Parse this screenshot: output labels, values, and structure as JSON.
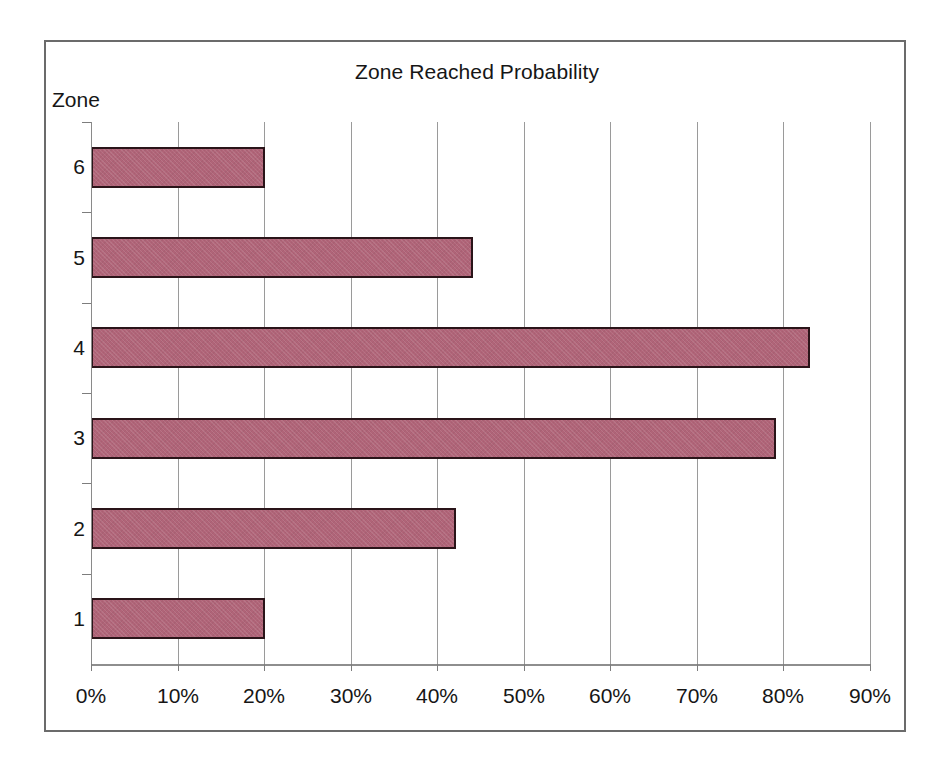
{
  "chart_data": {
    "type": "bar",
    "orientation": "horizontal",
    "title": "Zone Reached Probability",
    "xlabel": "",
    "ylabel": "Zone",
    "categories": [
      "1",
      "2",
      "3",
      "4",
      "5",
      "6"
    ],
    "values": [
      20,
      42,
      79,
      83,
      44,
      20
    ],
    "value_unit": "%",
    "xlim": [
      0,
      90
    ],
    "xticks": [
      0,
      10,
      20,
      30,
      40,
      50,
      60,
      70,
      80,
      90
    ],
    "xtick_labels": [
      "0%",
      "10%",
      "20%",
      "30%",
      "40%",
      "50%",
      "60%",
      "70%",
      "80%",
      "90%"
    ],
    "grid": "vertical",
    "legend": "none",
    "series": [
      {
        "name": "Zone Reached Probability",
        "values": [
          20,
          42,
          79,
          83,
          44,
          20
        ]
      }
    ],
    "bar_fill_color": "#b06478",
    "bar_border_color": "#2a1419",
    "gridline_color": "#9a9a9a",
    "frame_color": "#6b6b6b",
    "background_color": "#ffffff",
    "points": [
      {
        "category": "6",
        "value": 20
      },
      {
        "category": "5",
        "value": 44
      },
      {
        "category": "4",
        "value": 83
      },
      {
        "category": "3",
        "value": 79
      },
      {
        "category": "2",
        "value": 42
      },
      {
        "category": "1",
        "value": 20
      }
    ]
  }
}
